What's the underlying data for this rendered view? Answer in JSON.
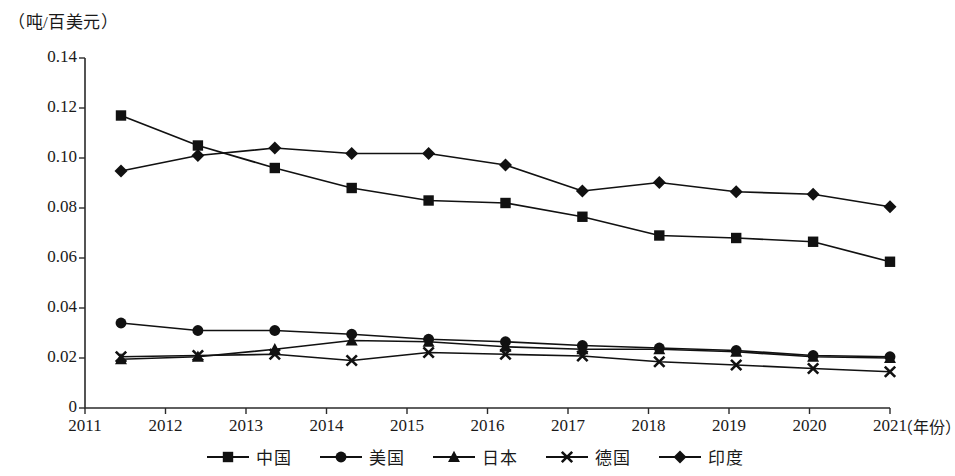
{
  "chart_data": {
    "type": "line",
    "title": "",
    "ylabel": "（吨/百美元）",
    "xlabel": "（年份）",
    "categories": [
      "2011",
      "2012",
      "2013",
      "2014",
      "2015",
      "2016",
      "2017",
      "2018",
      "2019",
      "2020",
      "2021"
    ],
    "ylim": [
      0,
      0.14
    ],
    "ytick_labels": [
      "0",
      "0.02",
      "0.04",
      "0.06",
      "0.08",
      "0.10",
      "0.12",
      "0.14"
    ],
    "ytick_values": [
      0,
      0.02,
      0.04,
      0.06,
      0.08,
      0.1,
      0.12,
      0.14
    ],
    "grid": false,
    "legend_position": "bottom",
    "series": [
      {
        "name": "中国",
        "marker": "square",
        "values": [
          0.117,
          0.105,
          0.096,
          0.088,
          0.083,
          0.082,
          0.0765,
          0.069,
          0.068,
          0.0665,
          0.0585
        ]
      },
      {
        "name": "美国",
        "marker": "circle",
        "values": [
          0.034,
          0.031,
          0.031,
          0.0295,
          0.0275,
          0.0265,
          0.025,
          0.024,
          0.023,
          0.021,
          0.0205
        ]
      },
      {
        "name": "日本",
        "marker": "triangle",
        "values": [
          0.0195,
          0.0205,
          0.0235,
          0.027,
          0.0265,
          0.0245,
          0.0235,
          0.0235,
          0.0225,
          0.0205,
          0.02
        ]
      },
      {
        "name": "德国",
        "marker": "x",
        "values": [
          0.0205,
          0.021,
          0.0215,
          0.019,
          0.0222,
          0.0215,
          0.0208,
          0.0185,
          0.0172,
          0.0158,
          0.0145
        ]
      },
      {
        "name": "印度",
        "marker": "diamond",
        "values": [
          0.0948,
          0.101,
          0.104,
          0.1018,
          0.1018,
          0.0972,
          0.0868,
          0.0902,
          0.0865,
          0.0855,
          0.0805
        ]
      }
    ]
  },
  "legend": {
    "items": [
      {
        "label": "中国",
        "marker": "square"
      },
      {
        "label": "美国",
        "marker": "circle"
      },
      {
        "label": "日本",
        "marker": "triangle"
      },
      {
        "label": "德国",
        "marker": "x"
      },
      {
        "label": "印度",
        "marker": "diamond"
      }
    ]
  },
  "colors": {
    "series": "#111111",
    "axis": "#2b2b2b",
    "background": "#ffffff"
  }
}
